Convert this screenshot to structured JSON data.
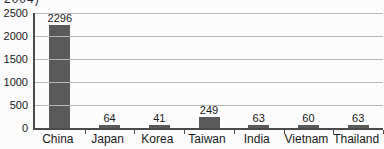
{
  "chart": {
    "clipped_title_fragment": "2004)",
    "colors": {
      "bar": "#5a5a5a",
      "gridline": "#b8b8b8",
      "axis": "#4a4a4a",
      "text": "#1a1a1a",
      "background": "#fcfcfc"
    }
  },
  "chart_data": {
    "type": "bar",
    "categories": [
      "China",
      "Japan",
      "Korea",
      "Taiwan",
      "India",
      "Vietnam",
      "Thailand"
    ],
    "values": [
      2296,
      64,
      41,
      249,
      63,
      60,
      63
    ],
    "title": "",
    "xlabel": "",
    "ylabel": "",
    "ylim": [
      0,
      2500
    ],
    "yticks": [
      0,
      500,
      1000,
      1500,
      2000,
      2500
    ],
    "grid": true,
    "legend": false,
    "value_labels": true
  }
}
